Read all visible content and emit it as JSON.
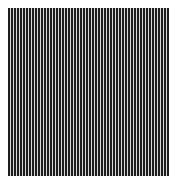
{
  "image": {
    "description": "vertical stripe pattern",
    "pattern": {
      "orientation": "vertical",
      "dark_color": "#1e1e1e",
      "light_color": "#d8d8d8",
      "background": "#ffffff"
    }
  }
}
